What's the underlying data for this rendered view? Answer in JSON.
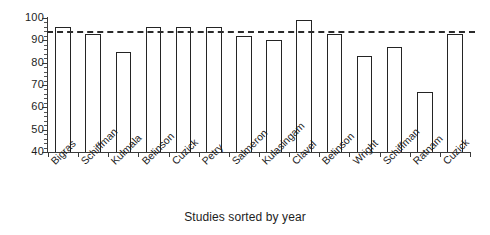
{
  "chart_data": {
    "type": "bar",
    "title": "",
    "xlabel": "Studies sorted by year",
    "ylabel": "",
    "categories": [
      "Bigras",
      "Schiffman",
      "Kulmala",
      "Belinson",
      "Cuzick",
      "Petry",
      "Salmeron",
      "Kulasingam",
      "Clavel",
      "Belinson",
      "Wright",
      "Schiffman",
      "Ratnam",
      "Cuzick"
    ],
    "values": [
      96,
      93,
      85,
      96,
      96,
      96,
      92,
      90,
      99,
      93,
      83,
      87,
      67,
      93
    ],
    "ylim": [
      40,
      100
    ],
    "yticks": [
      40,
      50,
      60,
      70,
      80,
      90,
      100
    ],
    "ytick_labels": [
      "40",
      "50",
      "60",
      "70",
      "80",
      "90",
      "100"
    ],
    "minor_tick_interval": 2,
    "grid": false,
    "legend": false,
    "reference_line": {
      "value": 94,
      "style": "dashed",
      "color": "#2b2b2b"
    },
    "bar_style": {
      "fill": "#ffffff",
      "edge": "#242424"
    }
  }
}
